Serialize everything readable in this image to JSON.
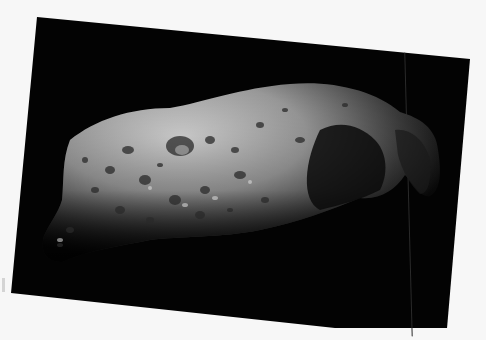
{
  "image": {
    "subject": "asteroid",
    "description": "Black-and-white photograph of a heavily cratered, elongated asteroid against a black sky, printed on a slightly rotated card on a white background",
    "colors": {
      "background": "#f7f7f7",
      "sky": "#030303",
      "surface_light": "#cfcfcf",
      "surface_mid": "#8a8a8a",
      "surface_shadow": "#1a1a1a"
    }
  }
}
